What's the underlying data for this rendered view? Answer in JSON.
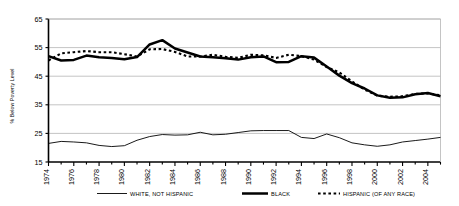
{
  "chart_data": {
    "type": "line",
    "title": "",
    "xlabel": "",
    "ylabel": "% Below Poverty Level",
    "ylim": [
      15,
      65
    ],
    "yticks": [
      15,
      25,
      35,
      45,
      55,
      65
    ],
    "xlim": [
      1974,
      2005
    ],
    "xticks": [
      1974,
      1976,
      1978,
      1980,
      1982,
      1984,
      1986,
      1988,
      1990,
      1992,
      1994,
      1996,
      1998,
      2000,
      2002,
      2004
    ],
    "xtick_labels": [
      "1974",
      "1976",
      "1978",
      "1980",
      "1982",
      "1984",
      "1986",
      "1988",
      "1990",
      "1992",
      "1994",
      "1996",
      "1998",
      "2000",
      "2002",
      "2004"
    ],
    "grid": true,
    "legend_position": "bottom",
    "x": [
      1974,
      1975,
      1976,
      1977,
      1978,
      1979,
      1980,
      1981,
      1982,
      1983,
      1984,
      1985,
      1986,
      1987,
      1988,
      1989,
      1990,
      1991,
      1992,
      1993,
      1994,
      1995,
      1996,
      1997,
      1998,
      1999,
      2000,
      2001,
      2002,
      2003,
      2004,
      2005
    ],
    "series": [
      {
        "name": "WHITE, NOT HISPANIC",
        "style": "thin-solid",
        "color": "#000000",
        "values": [
          21.5,
          22.2,
          22.0,
          21.7,
          20.8,
          20.4,
          20.7,
          22.6,
          23.9,
          24.6,
          24.4,
          24.5,
          25.4,
          24.5,
          24.7,
          25.3,
          25.9,
          26.0,
          26.0,
          26.0,
          23.6,
          23.2,
          24.8,
          23.5,
          21.7,
          21.0,
          20.5,
          21.0,
          22.0,
          22.5,
          23.0,
          23.6
        ]
      },
      {
        "name": "BLACK",
        "style": "thick-solid",
        "color": "#000000",
        "values": [
          52.0,
          50.5,
          50.7,
          52.2,
          51.6,
          51.4,
          50.9,
          51.7,
          56.1,
          57.6,
          54.7,
          53.3,
          51.9,
          51.6,
          51.3,
          50.8,
          51.6,
          51.9,
          49.9,
          50.0,
          52.0,
          51.5,
          48.4,
          45.2,
          42.6,
          40.7,
          38.3,
          37.5,
          37.6,
          38.7,
          39.1,
          38.0
        ]
      },
      {
        "name": "HISPANIC (OF ANY RACE)",
        "style": "dashed",
        "color": "#000000",
        "values": [
          50.5,
          53.0,
          53.4,
          53.8,
          53.4,
          53.4,
          52.7,
          51.9,
          54.4,
          54.5,
          53.5,
          51.9,
          51.9,
          52.5,
          51.8,
          51.4,
          52.5,
          52.3,
          51.4,
          52.5,
          52.0,
          50.8,
          48.2,
          46.3,
          43.2,
          40.3,
          38.2,
          37.8,
          38.0,
          38.8,
          39.0,
          38.3
        ]
      }
    ]
  },
  "legend": {
    "items": [
      {
        "label": "WHITE, NOT HISPANIC",
        "style": "thin-solid"
      },
      {
        "label": "BLACK",
        "style": "thick-solid"
      },
      {
        "label": "HISPANIC (OF ANY RACE)",
        "style": "dashed"
      }
    ]
  },
  "colors": {
    "axis": "#000000",
    "grid": "#b5b5b5",
    "background": "#ffffff",
    "series": "#000000"
  }
}
